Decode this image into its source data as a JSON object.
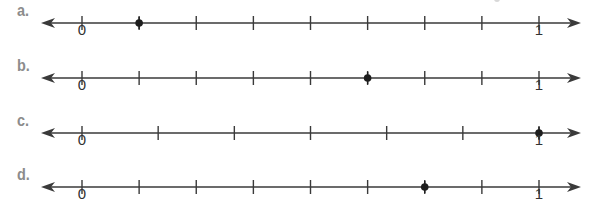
{
  "colors": {
    "label": "#8c8c8c",
    "line": "#3a3a3a",
    "text": "#333333",
    "dot": "#1e1e1e"
  },
  "geometry": {
    "x_zero": 82,
    "x_one": 539,
    "arrow_left_tip": 41,
    "arrow_right_tip": 581
  },
  "number_lines": [
    {
      "label": "a.",
      "y": 23,
      "divisions": 8,
      "dot_fraction": "1/8",
      "dot_position": 0.125,
      "start_label": "0",
      "end_label": "1"
    },
    {
      "label": "b.",
      "y": 78,
      "divisions": 8,
      "dot_fraction": "5/8",
      "dot_position": 0.625,
      "start_label": "0",
      "end_label": "1"
    },
    {
      "label": "c.",
      "y": 133,
      "divisions": 6,
      "dot_fraction": "6/6",
      "dot_position": 1.0,
      "start_label": "0",
      "end_label": "1"
    },
    {
      "label": "d.",
      "y": 187,
      "divisions": 8,
      "dot_fraction": "6/8",
      "dot_position": 0.75,
      "start_label": "0",
      "end_label": "1"
    }
  ]
}
